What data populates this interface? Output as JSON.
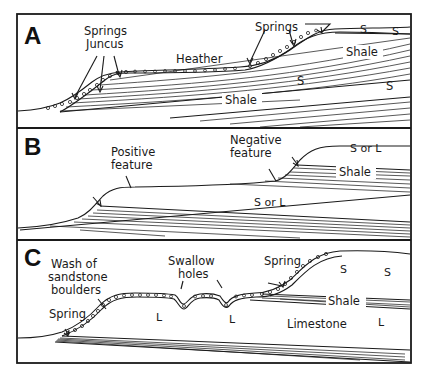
{
  "figure": {
    "panels": [
      {
        "id": "A",
        "label": "A",
        "annotations": {
          "springs_juncus_line1": "Springs",
          "springs_juncus_line2": "Juncus",
          "heather": "Heather",
          "springs_right": "Springs",
          "s_top_1": "S",
          "s_top_2": "S",
          "shale_upper": "Shale",
          "s_mid_1": "S",
          "s_mid_2": "S",
          "shale_lower": "Shale"
        }
      },
      {
        "id": "B",
        "label": "B",
        "annotations": {
          "positive_line1": "Positive",
          "positive_line2": "feature",
          "negative_line1": "Negative",
          "negative_line2": "feature",
          "s_or_l_upper": "S or L",
          "shale": "Shale",
          "s_or_l_lower": "S or L"
        }
      },
      {
        "id": "C",
        "label": "C",
        "annotations": {
          "wash_line1": "Wash of",
          "wash_line2": "sandstone",
          "wash_line3": "boulders",
          "swallow_line1": "Swallow",
          "swallow_line2": "holes",
          "spring_left": "Spring",
          "spring_right": "Spring",
          "s_1": "S",
          "s_2": "S",
          "shale": "Shale",
          "l_1": "L",
          "l_2": "L",
          "limestone": "Limestone",
          "l_3": "L"
        }
      }
    ]
  }
}
